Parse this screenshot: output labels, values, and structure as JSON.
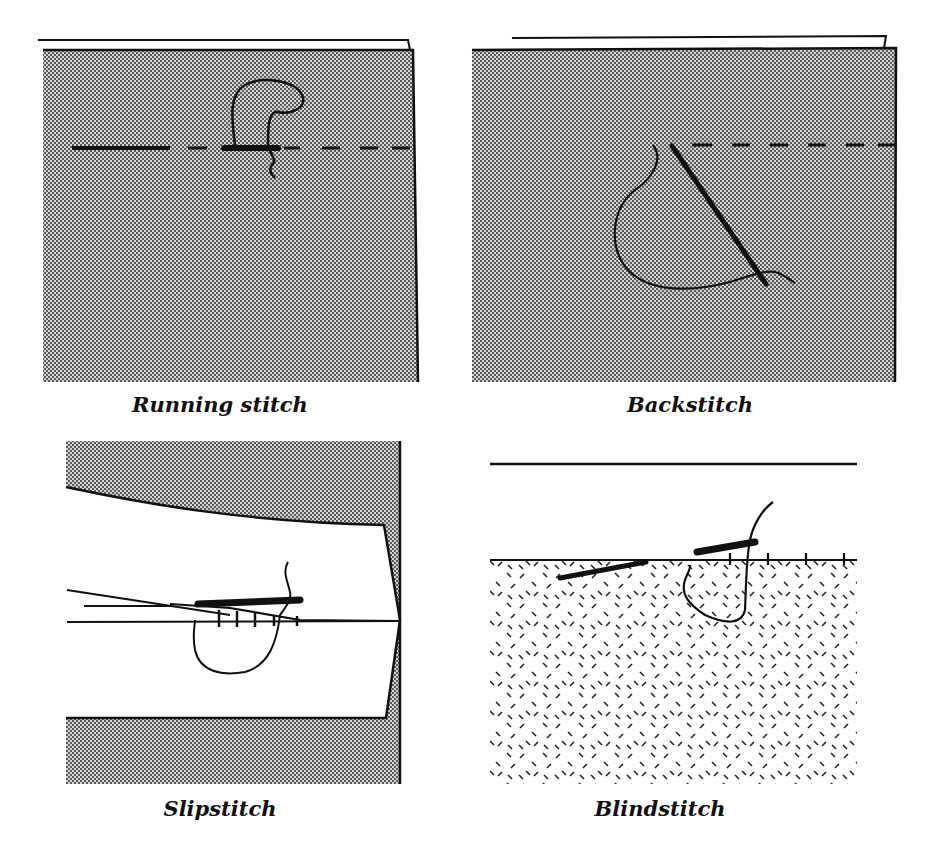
{
  "figure": {
    "panels": [
      {
        "id": "running",
        "caption": "Running stitch"
      },
      {
        "id": "back",
        "caption": "Backstitch"
      },
      {
        "id": "slip",
        "caption": "Slipstitch"
      },
      {
        "id": "blind",
        "caption": "Blindstitch"
      }
    ]
  },
  "colors": {
    "ink": "#111111",
    "fabric_dot": "#555555",
    "fabric_bg": "#c8c8c8",
    "paper": "#ffffff"
  }
}
